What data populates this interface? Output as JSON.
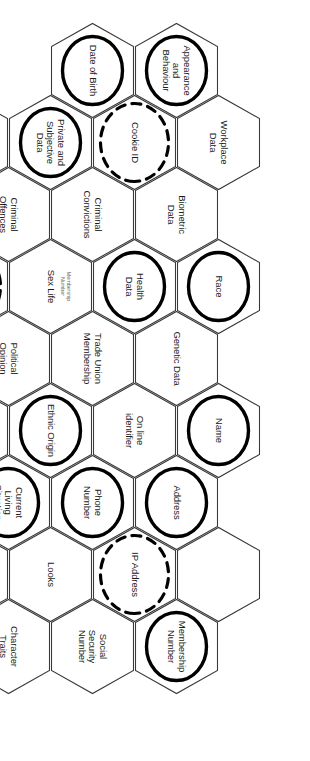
{
  "diagram": {
    "orientation": "rotated-90",
    "legend": {
      "plain": "plain hexagon - ordinary personal data",
      "solid_ellipse": "bold solid ellipse highlight",
      "dashed_ellipse": "dashed ellipse highlight"
    },
    "colors": {
      "hex_stroke": "#3a3a3a",
      "hex_fill": "#ffffff",
      "ellipse_stroke": "#000000",
      "text": "#1b1b1b",
      "sublabel_text": "#6d6d6d",
      "background": "#ffffff"
    }
  },
  "cells": [
    {
      "id": "appearance-and-behaviour",
      "label": "Appearance\nand\nBehaviour",
      "ellipse": "solid",
      "col": 0,
      "row": 1
    },
    {
      "id": "date-of-birth",
      "label": "Date of Birth",
      "ellipse": "solid",
      "col": 0,
      "row": 2
    },
    {
      "id": "workplace-data",
      "label": "Workplace\nData",
      "ellipse": "none",
      "col": 1,
      "row": 0
    },
    {
      "id": "cookie-id",
      "label": "Cookie ID",
      "ellipse": "dashed",
      "col": 1,
      "row": 1
    },
    {
      "id": "private-and-subjective-data",
      "label": "Private and\nSubjective\nData",
      "ellipse": "solid",
      "col": 1,
      "row": 2
    },
    {
      "id": "geo-tracking-data",
      "label": "Geo-Tracking\nData",
      "ellipse": "none",
      "col": 1,
      "row": 3
    },
    {
      "id": "sickness",
      "label": "Sickness",
      "ellipse": "solid",
      "col": 1,
      "row": 4
    },
    {
      "id": "biometric-data",
      "label": "Biometric\nData",
      "ellipse": "none",
      "col": 2,
      "row": 1
    },
    {
      "id": "criminal-convictions",
      "label": "Criminal\nConvictions",
      "ellipse": "none",
      "col": 2,
      "row": 2
    },
    {
      "id": "criminal-offences",
      "label": "Criminal\nOffences",
      "ellipse": "none",
      "col": 2,
      "row": 3
    },
    {
      "id": "education-information",
      "label": "Education\nInformation",
      "ellipse": "solid",
      "col": 2,
      "row": 4
    },
    {
      "id": "race",
      "label": "Race",
      "ellipse": "solid",
      "col": 3,
      "row": 0
    },
    {
      "id": "health-data",
      "label": "Health\nData",
      "ellipse": "solid",
      "col": 3,
      "row": 1
    },
    {
      "id": "sex-life",
      "label": "Sex Life",
      "sublabel": "Membership\nNumber",
      "ellipse": "none",
      "col": 3,
      "row": 2
    },
    {
      "id": "email-address",
      "label": "Email\nAddress",
      "ellipse": "dashed",
      "col": 3,
      "row": 3
    },
    {
      "id": "salary",
      "label": "Salary",
      "ellipse": "none",
      "col": 3,
      "row": 4
    },
    {
      "id": "genetic-data",
      "label": "Genetic Data",
      "ellipse": "none",
      "col": 4,
      "row": 1
    },
    {
      "id": "trade-union-membership",
      "label": "Trade Union\nMembership",
      "ellipse": "none",
      "col": 4,
      "row": 2
    },
    {
      "id": "political-opinion",
      "label": "Political\nOpinion",
      "ellipse": "none",
      "col": 4,
      "row": 3
    },
    {
      "id": "location-data",
      "label": "Location\nData",
      "ellipse": "dashed",
      "col": 4,
      "row": 4
    },
    {
      "id": "name",
      "label": "Name",
      "ellipse": "solid",
      "col": 5,
      "row": 0
    },
    {
      "id": "on-line-identifier",
      "label": "On line\nidentifier",
      "ellipse": "none",
      "col": 5,
      "row": 1
    },
    {
      "id": "ethnic-origin",
      "label": "Ethnic Origin",
      "ellipse": "solid",
      "col": 5,
      "row": 2
    },
    {
      "id": "sexual-orientation",
      "label": "Sexual\nOrientation",
      "ellipse": "none",
      "col": 5,
      "row": 3
    },
    {
      "id": "photograph",
      "label": "Photograph",
      "ellipse": "solid",
      "col": 5,
      "row": 4
    },
    {
      "id": "address",
      "label": "Address",
      "ellipse": "solid",
      "col": 6,
      "row": 1
    },
    {
      "id": "phone-number",
      "label": "Phone\nNumber",
      "ellipse": "solid",
      "col": 6,
      "row": 2
    },
    {
      "id": "current-living-situation",
      "label": "Current\nLiving\nSituation",
      "ellipse": "solid",
      "col": 6,
      "row": 3
    },
    {
      "id": "eye-colour",
      "label": "Eye Colour",
      "ellipse": "none",
      "col": 6,
      "row": 4
    },
    {
      "id": "empty-cell",
      "label": "",
      "ellipse": "none",
      "col": 7,
      "row": 0
    },
    {
      "id": "ip-address",
      "label": "IP Address",
      "ellipse": "dashed",
      "col": 7,
      "row": 1
    },
    {
      "id": "looks",
      "label": "Looks",
      "ellipse": "none",
      "col": 7,
      "row": 2
    },
    {
      "id": "tax-information",
      "label": "Tax\nInformation",
      "ellipse": "none",
      "col": 7,
      "row": 3
    },
    {
      "id": "biographical-information",
      "label": "Biographical\nInformation",
      "ellipse": "solid",
      "col": 7,
      "row": 4
    },
    {
      "id": "membership-number",
      "label": "Membership\nNumber",
      "ellipse": "solid",
      "col": 8,
      "row": 1
    },
    {
      "id": "social-security-number",
      "label": "Social\nSecurity\nNumber",
      "ellipse": "none",
      "col": 8,
      "row": 2
    },
    {
      "id": "character-traits",
      "label": "Character\nTraits",
      "ellipse": "none",
      "col": 8,
      "row": 3
    }
  ]
}
